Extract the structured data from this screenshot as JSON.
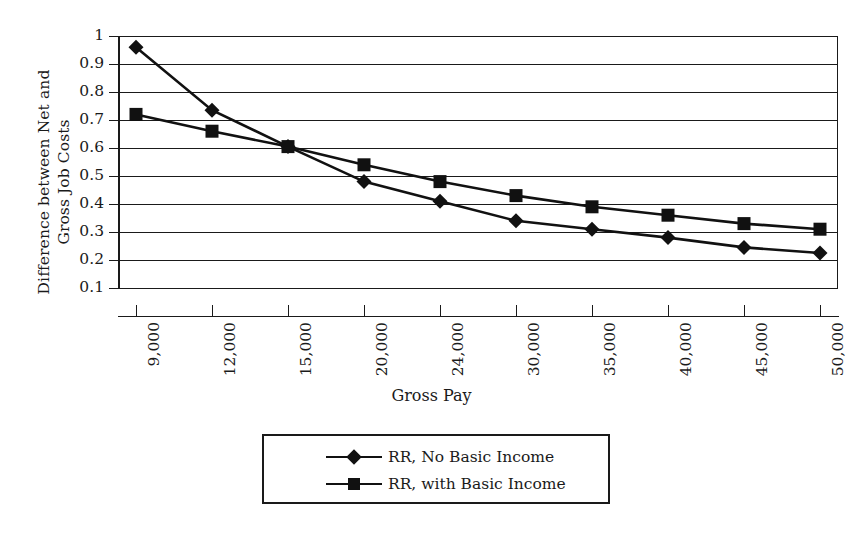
{
  "chart_data": {
    "type": "line",
    "title": "",
    "xlabel": "Gross Pay",
    "ylabel": "Difference between Net and Gross Job Costs",
    "ylabel_lines": [
      "Difference between Net and",
      "Gross Job Costs"
    ],
    "categories": [
      "9,000",
      "12,000",
      "15,000",
      "20,000",
      "24,000",
      "30,000",
      "35,000",
      "40,000",
      "45,000",
      "50,000"
    ],
    "x_values": [
      9000,
      12000,
      15000,
      20000,
      24000,
      30000,
      35000,
      40000,
      45000,
      50000
    ],
    "ylim": [
      0.1,
      1
    ],
    "ytick_labels": [
      "1",
      "0.9",
      "0.8",
      "0.7",
      "0.6",
      "0.5",
      "0.4",
      "0.3",
      "0.2",
      "0.1"
    ],
    "ytick_values": [
      1,
      0.9,
      0.8,
      0.7,
      0.6,
      0.5,
      0.4,
      0.3,
      0.2,
      0.1
    ],
    "grid": "horizontal",
    "legend_position": "bottom",
    "series": [
      {
        "name": "RR, No Basic Income",
        "marker": "diamond",
        "color": "#111111",
        "values": [
          0.96,
          0.735,
          0.605,
          0.48,
          0.41,
          0.34,
          0.31,
          0.28,
          0.245,
          0.225
        ]
      },
      {
        "name": "RR, with Basic Income",
        "marker": "square",
        "color": "#111111",
        "values": [
          0.72,
          0.66,
          0.605,
          0.54,
          0.48,
          0.43,
          0.39,
          0.36,
          0.33,
          0.31
        ]
      }
    ]
  },
  "legend": {
    "items": [
      {
        "label": "RR, No Basic Income",
        "marker": "diamond"
      },
      {
        "label": "RR, with Basic Income",
        "marker": "square"
      }
    ]
  }
}
